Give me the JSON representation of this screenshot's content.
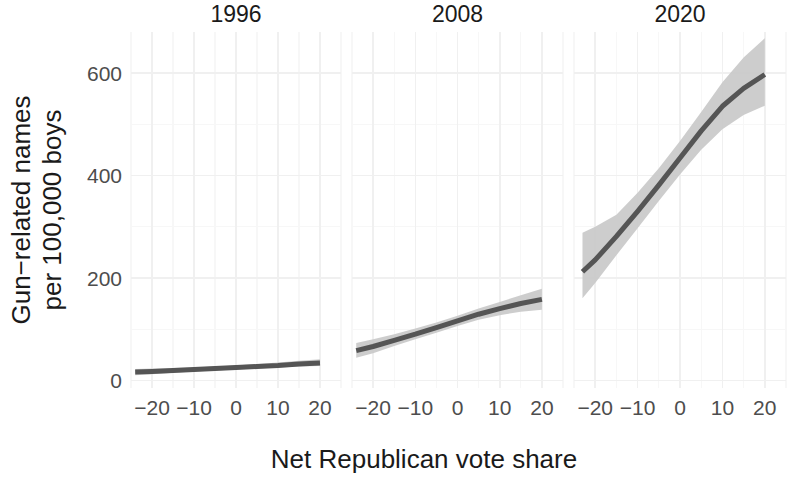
{
  "chart_data": {
    "type": "line",
    "title": "",
    "subtitle": "",
    "xlabel": "Net Republican vote share",
    "ylabel": "Gun−related names per 100,000 boys",
    "ylabel_lines": [
      "Gun−related names",
      "per 100,000 boys"
    ],
    "facet_variable": "year",
    "facets": [
      "1996",
      "2008",
      "2020"
    ],
    "xlim": [
      -25,
      25
    ],
    "ylim": [
      -15,
      680
    ],
    "x_ticks": [
      -20,
      -10,
      0,
      10,
      20
    ],
    "x_tick_labels": [
      "−20",
      "−10",
      "0",
      "10",
      "20"
    ],
    "y_ticks": [
      0,
      200,
      400,
      600
    ],
    "y_tick_labels": [
      "0",
      "200",
      "400",
      "600"
    ],
    "x_minor_ticks": [
      -25,
      -15,
      -5,
      5,
      15,
      25
    ],
    "y_minor_ticks": [
      100,
      300,
      500
    ],
    "grid": true,
    "legend": "none",
    "line_color": "#555555",
    "ribbon_color": "#c9c9c9",
    "grid_color": "#f0f0f0",
    "background_color": "#ffffff",
    "series": [
      {
        "name": "1996",
        "facet": "1996",
        "x": [
          -24,
          -20,
          -15,
          -10,
          -5,
          0,
          5,
          10,
          15,
          20
        ],
        "y": [
          16,
          17,
          19,
          21,
          23,
          25,
          27,
          29,
          32,
          34
        ],
        "ymin": [
          10,
          12,
          15,
          17,
          19,
          21,
          23,
          25,
          27,
          28
        ],
        "ymax": [
          22,
          23,
          24,
          25,
          27,
          29,
          32,
          35,
          38,
          41
        ]
      },
      {
        "name": "2008",
        "facet": "2008",
        "x": [
          -24,
          -20,
          -15,
          -10,
          -5,
          0,
          5,
          10,
          15,
          20
        ],
        "y": [
          58,
          66,
          78,
          90,
          103,
          116,
          129,
          140,
          150,
          158
        ],
        "ymin": [
          44,
          53,
          67,
          80,
          93,
          106,
          118,
          127,
          134,
          138
        ],
        "ymax": [
          73,
          80,
          90,
          101,
          113,
          126,
          140,
          153,
          166,
          179
        ]
      },
      {
        "name": "2020",
        "facet": "2020",
        "x": [
          -23,
          -20,
          -15,
          -10,
          -5,
          0,
          5,
          10,
          15,
          20
        ],
        "y": [
          212,
          235,
          281,
          330,
          381,
          434,
          487,
          535,
          570,
          597
        ],
        "ymin": [
          160,
          190,
          244,
          297,
          350,
          402,
          450,
          490,
          518,
          536
        ],
        "ymax": [
          288,
          300,
          323,
          366,
          414,
          467,
          524,
          582,
          630,
          668
        ]
      }
    ]
  },
  "axis": {
    "x_title": "Net Republican vote share",
    "y_title_line1": "Gun−related names",
    "y_title_line2": "per 100,000 boys"
  }
}
